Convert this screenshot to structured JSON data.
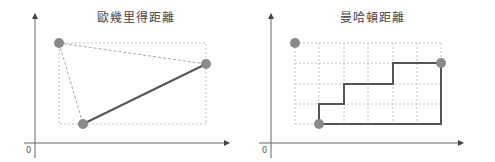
{
  "diagrams": [
    {
      "title": "歐幾里得距離",
      "origin_label": "0",
      "points": [
        [
          59,
          43
        ],
        [
          206,
          64
        ],
        [
          83,
          124
        ]
      ],
      "description": "Euclidean distance: straight line between two points, dashed triangle & bounding box"
    },
    {
      "title": "曼哈頓距離",
      "origin_label": "0",
      "points": [
        [
          295,
          43
        ],
        [
          441,
          64
        ],
        [
          319,
          124
        ]
      ],
      "description": "Manhattan distance: staircase path along grid vs. L-shaped path"
    }
  ],
  "colors": {
    "axis": "#555555",
    "point": "#8a8a8a",
    "line": "#555555",
    "dashed": "#bbbbbb"
  }
}
